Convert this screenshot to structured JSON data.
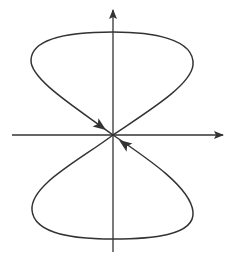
{
  "diagram": {
    "colors": {
      "stroke": "#333333",
      "background": "#ffffff"
    },
    "axes": {
      "horizontal": {
        "x1": 12,
        "y": 135,
        "x2": 223,
        "arrow": "right"
      },
      "vertical": {
        "x": 113,
        "y1": 252,
        "y2": 10,
        "arrow": "up"
      }
    },
    "loops": [
      {
        "name": "upper-loop",
        "path": "M113 135 C 80 110, 30 80, 31 60 C 32 35, 80 32, 113 32 C 150 32, 195 38, 193 65 C 191 85, 150 110, 113 135"
      },
      {
        "name": "lower-loop",
        "path": "M113 135 C 80 160, 30 185, 32 210 C 34 236, 80 239, 113 239 C 150 239, 195 236, 193 212 C 191 188, 150 160, 113 135"
      }
    ],
    "flow_arrows": [
      {
        "name": "arrow-upper-left-branch",
        "direction": "toward-origin",
        "tip": [
          106,
          130
        ],
        "angle_deg": 36
      },
      {
        "name": "arrow-lower-right-branch",
        "direction": "toward-origin",
        "tip": [
          119,
          140
        ],
        "angle_deg": 216
      }
    ]
  }
}
